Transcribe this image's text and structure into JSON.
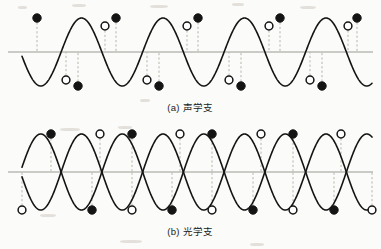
{
  "figure": {
    "background_color": "#fbfbf9",
    "ink_color": "#141414",
    "axis_color": "#9a9a96",
    "guide_color": "#b9b5ad"
  },
  "panels": [
    {
      "id": "a",
      "caption_label": "(a)",
      "caption_text": "声学支",
      "branch": "acoustic"
    },
    {
      "id": "b",
      "caption_label": "(b)",
      "caption_text": "光学支",
      "branch": "optical"
    }
  ],
  "chart_data": [
    {
      "type": "line",
      "title": "(a) 声学支",
      "xlabel": "",
      "ylabel": "",
      "grid": false,
      "legend": "none",
      "axis_y": 52,
      "xlim": [
        0,
        381
      ],
      "ylim": [
        -40,
        40
      ],
      "series": [
        {
          "name": "acoustic-wave",
          "form": "sine",
          "amplitude": 34,
          "wavelength": 81.5,
          "phase_deg": 90,
          "x_start": 22,
          "x_end": 372
        }
      ],
      "markers": {
        "filled": {
          "label": "atom-type-1",
          "style": "filled-circle",
          "x": [
            37,
            78,
            116,
            159,
            198,
            241,
            280,
            322,
            357
          ],
          "y": [
            18,
            86,
            18,
            86,
            18,
            86,
            18,
            86,
            18
          ]
        },
        "open": {
          "label": "atom-type-2",
          "style": "open-circle",
          "x": [
            66,
            105,
            147,
            187,
            229,
            269,
            310,
            348
          ],
          "y": [
            80,
            26,
            80,
            26,
            80,
            26,
            80,
            26
          ]
        }
      },
      "guides": "vertical dashed drop-lines from every marker to the axis"
    },
    {
      "type": "line",
      "title": "(b) 光学支",
      "xlabel": "",
      "ylabel": "",
      "grid": false,
      "legend": "none",
      "axis_y": 52,
      "xlim": [
        0,
        381
      ],
      "ylim": [
        -45,
        45
      ],
      "series": [
        {
          "name": "optical-wave-sublattice-1",
          "form": "sine",
          "amplitude": 38,
          "wavelength": 81.5,
          "phase_deg": 90,
          "x_start": 22,
          "x_end": 372
        },
        {
          "name": "optical-wave-sublattice-2",
          "form": "sine",
          "amplitude": 38,
          "wavelength": 81.5,
          "phase_deg": -90,
          "x_start": 22,
          "x_end": 372
        }
      ],
      "markers": {
        "filled": {
          "label": "atom-type-1",
          "style": "filled-circle",
          "x": [
            51,
            132,
            212,
            293
          ],
          "y": [
            14,
            14,
            14,
            14
          ]
        },
        "filled_lower": {
          "label": "atom-type-1-antiphase",
          "style": "filled-circle",
          "x": [
            92,
            172,
            253,
            334
          ],
          "y": [
            90,
            90,
            90,
            90
          ]
        },
        "open": {
          "label": "atom-type-2",
          "style": "open-circle",
          "x": [
            100,
            180,
            261,
            341
          ],
          "y": [
            14,
            14,
            14,
            14
          ]
        },
        "open_lower": {
          "label": "atom-type-2-antiphase",
          "style": "open-circle",
          "x": [
            22,
            132,
            212,
            293,
            372
          ],
          "y": [
            90,
            90,
            90,
            90,
            90
          ]
        }
      },
      "guides": "vertical dashed drop-lines from every marker to the axis"
    }
  ]
}
